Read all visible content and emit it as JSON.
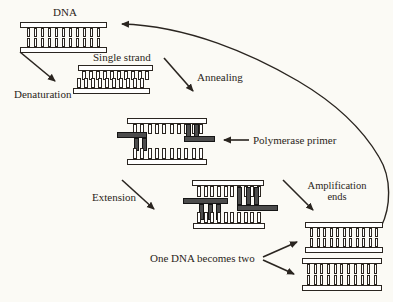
{
  "diagram": {
    "colors": {
      "background": "#fbfaf5",
      "ink": "#2a2520",
      "strand_fill": "#ffffff",
      "primer_fill": "#4c4c4c"
    },
    "labels": {
      "dna": "DNA",
      "denaturation": "Denaturation",
      "single_strand": "Single strand",
      "annealing": "Annealing",
      "polymerase_primer": "Polymerase primer",
      "extension": "Extension",
      "amplification_line1": "Amplification",
      "amplification_line2": "ends",
      "one_dna_becomes_two": "One DNA becomes two"
    }
  }
}
